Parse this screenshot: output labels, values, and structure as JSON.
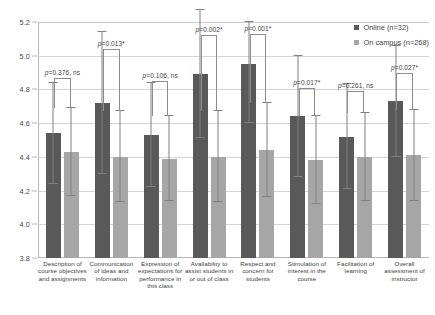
{
  "chart_data": {
    "type": "bar",
    "title": "",
    "xlabel": "",
    "ylabel": "",
    "ylim": [
      3.8,
      5.2
    ],
    "ytick_step": 0.2,
    "yticks": [
      "5.2",
      "5.0",
      "4.8",
      "4.6",
      "4.4",
      "4.2",
      "4.0",
      "3.8"
    ],
    "grid": true,
    "legend_position": "top-right",
    "categories": [
      "Description of course objectives and assignments",
      "Communication of ideas and information",
      "Expression of expectations for performance in this class",
      "Availability to assist students in or out of class",
      "Respect and concern for students",
      "Stimulation of interest in the course",
      "Facilitation of learning",
      "Overall assessment of instructor"
    ],
    "series": [
      {
        "name": "Online (n=32)",
        "color": "#595959",
        "values": [
          4.54,
          4.72,
          4.53,
          4.89,
          4.95,
          4.64,
          4.52,
          4.73
        ],
        "err_low": [
          0.3,
          0.42,
          0.31,
          0.38,
          0.35,
          0.36,
          0.31,
          0.33
        ],
        "err_high": [
          0.3,
          0.42,
          0.31,
          0.38,
          0.25,
          0.36,
          0.31,
          0.33
        ]
      },
      {
        "name": "On campus (n=268)",
        "color": "#a6a6a6",
        "values": [
          4.43,
          4.4,
          4.39,
          4.4,
          4.44,
          4.38,
          4.4,
          4.41
        ],
        "err_low": [
          0.26,
          0.27,
          0.25,
          0.27,
          0.28,
          0.26,
          0.26,
          0.27
        ],
        "err_high": [
          0.26,
          0.27,
          0.25,
          0.27,
          0.28,
          0.26,
          0.26,
          0.27
        ]
      }
    ],
    "annotations": [
      {
        "text": "p=0.376, ns",
        "group": 0,
        "bracket_top": 4.87
      },
      {
        "text": "p=0.013*",
        "group": 1,
        "bracket_top": 5.04
      },
      {
        "text": "p=0.106, ns",
        "group": 2,
        "bracket_top": 4.85
      },
      {
        "text": "p=0.002*",
        "group": 3,
        "bracket_top": 5.12
      },
      {
        "text": "p=0.001*",
        "group": 4,
        "bracket_top": 5.13
      },
      {
        "text": "p=0.017*",
        "group": 5,
        "bracket_top": 4.81
      },
      {
        "text": "p=0.261, ns",
        "group": 6,
        "bracket_top": 4.79
      },
      {
        "text": "p=0.027*",
        "group": 7,
        "bracket_top": 4.9
      }
    ]
  },
  "legend": {
    "items": [
      {
        "label": "Online (n=32)"
      },
      {
        "label": "On campus (n=268)"
      }
    ]
  }
}
